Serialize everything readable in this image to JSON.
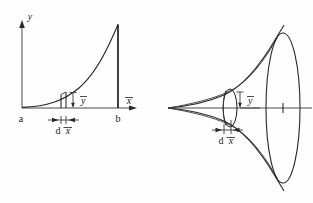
{
  "figure": {
    "background_color": "#fefefe",
    "ink_color": "#1a1a1a",
    "width": 313,
    "height": 203
  },
  "left_diagram": {
    "name": "area-under-curve",
    "axis_y_label": "y",
    "axis_x_label": "x",
    "left_bound_label": "a",
    "right_bound_label": "b",
    "strip_height_label": "y",
    "strip_width_label": "dx",
    "strip_width_label_d": "d",
    "strip_width_label_x": "x",
    "axis_origin_x": 22,
    "axis_origin_y": 108,
    "axis_top_y": 24,
    "axis_right_x": 128,
    "curve_start_x": 22,
    "curve_end_x": 118,
    "curve_peak_y": 24,
    "strip_x": 61,
    "strip_width": 5
  },
  "right_diagram": {
    "name": "solid-of-revolution",
    "strip_height_label": "y",
    "strip_width_label_d": "d",
    "strip_width_label_x": "x",
    "apex_x": 168,
    "apex_y": 108,
    "base_center_x": 283,
    "base_center_y": 108,
    "base_rx": 17,
    "base_ry": 75,
    "disc_center_x": 230,
    "disc_rx": 7,
    "disc_ry": 19
  }
}
